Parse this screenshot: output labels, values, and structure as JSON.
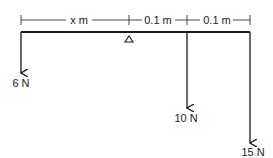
{
  "diagram": {
    "type": "lever / beam equilibrium",
    "dimensions": [
      {
        "label": "x m",
        "from": "left end",
        "to": "pivot"
      },
      {
        "label": "0.1 m",
        "from": "pivot",
        "to": "10 N load"
      },
      {
        "label": "0.1 m",
        "from": "10 N load",
        "to": "right end"
      }
    ],
    "support": {
      "type": "triangle-fulcrum"
    },
    "forces": [
      {
        "label": "6 N",
        "position": "left end",
        "direction": "down"
      },
      {
        "label": "10 N",
        "position": "0.1 m right of pivot",
        "direction": "down"
      },
      {
        "label": "15 N",
        "position": "right end",
        "direction": "down"
      }
    ],
    "colors": {
      "line": "#1a1a1a",
      "background": "#ffffff"
    }
  }
}
